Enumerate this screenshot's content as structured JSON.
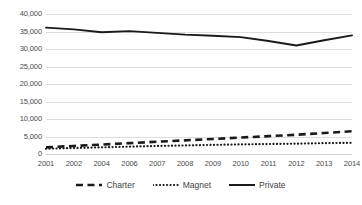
{
  "chart_data": {
    "type": "line",
    "title": "",
    "subtitle": "",
    "xlabel": "",
    "ylabel": "",
    "ylim": [
      0,
      40000
    ],
    "grid": true,
    "legend_position": "bottom",
    "categories": [
      "2001",
      "2002",
      "2004",
      "2006",
      "2007",
      "2008",
      "2009",
      "2010",
      "2011",
      "2012",
      "2013",
      "2014"
    ],
    "y_ticks": [
      0,
      5000,
      10000,
      15000,
      20000,
      25000,
      30000,
      35000,
      40000
    ],
    "y_tick_labels": [
      "0",
      "5,000",
      "10,000",
      "15,000",
      "20,000",
      "25,000",
      "30,000",
      "35,000",
      "40,000"
    ],
    "series": [
      {
        "name": "Charter",
        "style": "dashed",
        "color": "#1a1a1a",
        "values": [
          1900,
          2300,
          2700,
          3100,
          3500,
          3900,
          4300,
          4700,
          5100,
          5500,
          6000,
          6500
        ]
      },
      {
        "name": "Magnet",
        "style": "dotted",
        "color": "#1a1a1a",
        "values": [
          1500,
          1700,
          1900,
          2100,
          2300,
          2450,
          2600,
          2750,
          2850,
          2950,
          3100,
          3200
        ]
      },
      {
        "name": "Private",
        "style": "solid",
        "color": "#1a1a1a",
        "values": [
          36100,
          35600,
          34800,
          35100,
          34600,
          34100,
          33800,
          33400,
          32300,
          31000,
          32500,
          33900
        ]
      }
    ]
  },
  "colors": {
    "series_line": "#1a1a1a",
    "gridline": "#dedede",
    "axis_text": "#4a4a4a",
    "background": "#ffffff"
  },
  "legend": {
    "items": [
      {
        "label": "Charter",
        "swatch": "dashed-line-swatch"
      },
      {
        "label": "Magnet",
        "swatch": "dotted-line-swatch"
      },
      {
        "label": "Private",
        "swatch": "solid-line-swatch"
      }
    ]
  }
}
